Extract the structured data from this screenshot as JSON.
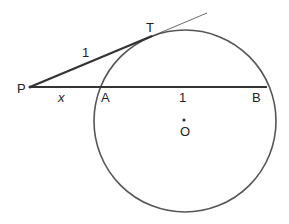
{
  "diagram": {
    "labels": {
      "P": "P",
      "T": "T",
      "A": "A",
      "B": "B",
      "O": "O",
      "PT_length": "1",
      "PA_length": "x",
      "AB_length": "1"
    },
    "colors": {
      "stroke": "#333333",
      "circle": "#555555",
      "background": "#ffffff"
    }
  }
}
